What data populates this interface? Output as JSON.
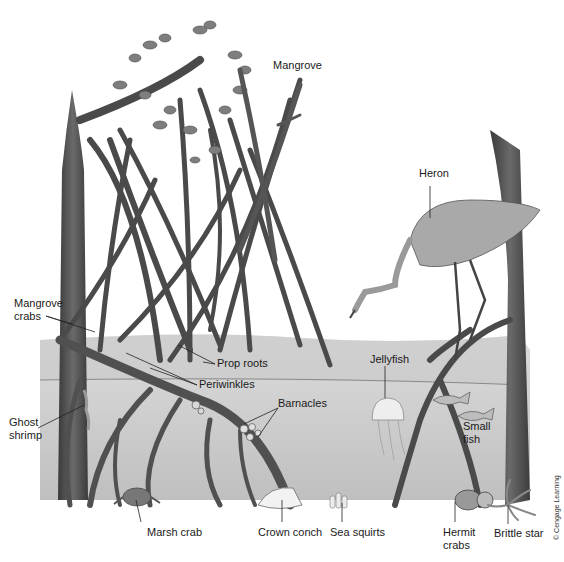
{
  "diagram": {
    "colors": {
      "background": "#ffffff",
      "water_surface": "#cfcfcf",
      "water_deep": "#bdbdbd",
      "sediment": "#ffffff",
      "bark": "#4a4a4a",
      "leaf": "#7a7a7a",
      "label_text": "#1a1a1a",
      "leader_line": "#222222"
    },
    "labels": [
      {
        "id": "mangrove",
        "text": "Mangrove",
        "x": 273,
        "y": 65
      },
      {
        "id": "heron",
        "text": "Heron",
        "x": 419,
        "y": 173
      },
      {
        "id": "mangrove-crabs",
        "text": "Mangrove\ncrabs",
        "x": 14,
        "y": 302
      },
      {
        "id": "prop-roots",
        "text": "Prop roots",
        "x": 217,
        "y": 359
      },
      {
        "id": "periwinkles",
        "text": "Periwinkles",
        "x": 199,
        "y": 380
      },
      {
        "id": "jellyfish",
        "text": "Jellyfish",
        "x": 370,
        "y": 354
      },
      {
        "id": "barnacles",
        "text": "Barnacles",
        "x": 278,
        "y": 402
      },
      {
        "id": "ghost-shrimp",
        "text": "Ghost\nshrimp",
        "x": 9,
        "y": 420
      },
      {
        "id": "small-fish",
        "text": "Small\nfish",
        "x": 463,
        "y": 422
      },
      {
        "id": "marsh-crab",
        "text": "Marsh crab",
        "x": 147,
        "y": 527
      },
      {
        "id": "crown-conch",
        "text": "Crown conch",
        "x": 258,
        "y": 527
      },
      {
        "id": "sea-squirts",
        "text": "Sea squirts",
        "x": 330,
        "y": 527
      },
      {
        "id": "hermit-crabs",
        "text": "Hermit\ncrabs",
        "x": 443,
        "y": 527
      },
      {
        "id": "brittle-star",
        "text": "Brittle star",
        "x": 494,
        "y": 529
      }
    ],
    "credit": "© Cengage Learning"
  }
}
